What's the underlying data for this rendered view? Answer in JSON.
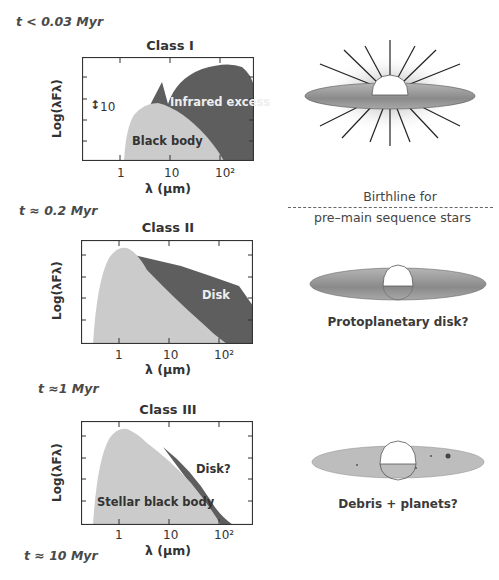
{
  "stages": [
    {
      "time_label": "t < 0.03 Myr",
      "class": "Class I",
      "labels": [
        "Infrared excess",
        "Black body"
      ],
      "scale_marker": "10"
    },
    {
      "time_label": "t ≈ 0.2 Myr",
      "class": "Class II",
      "labels": [
        "Disk"
      ]
    },
    {
      "time_label": "t ≈1 Myr",
      "class": "Class III",
      "labels": [
        "Disk?",
        "Stellar black body"
      ]
    },
    {
      "time_label": "t ≈ 10 Myr"
    }
  ],
  "axes": {
    "ylabel": "Log(λFλ)",
    "xlabel": "λ (μm)",
    "xticks": [
      "1",
      "10",
      "10²"
    ]
  },
  "illustrations": {
    "birthline_top": "Birthline for",
    "birthline_bottom": "pre–main sequence stars",
    "class2_caption": "Protoplanetary disk?",
    "class3_caption": "Debris + planets?"
  },
  "colors": {
    "blackbody": "#c8c8c8",
    "excess": "#5a5a5a",
    "disk": "#9a9a9a"
  }
}
